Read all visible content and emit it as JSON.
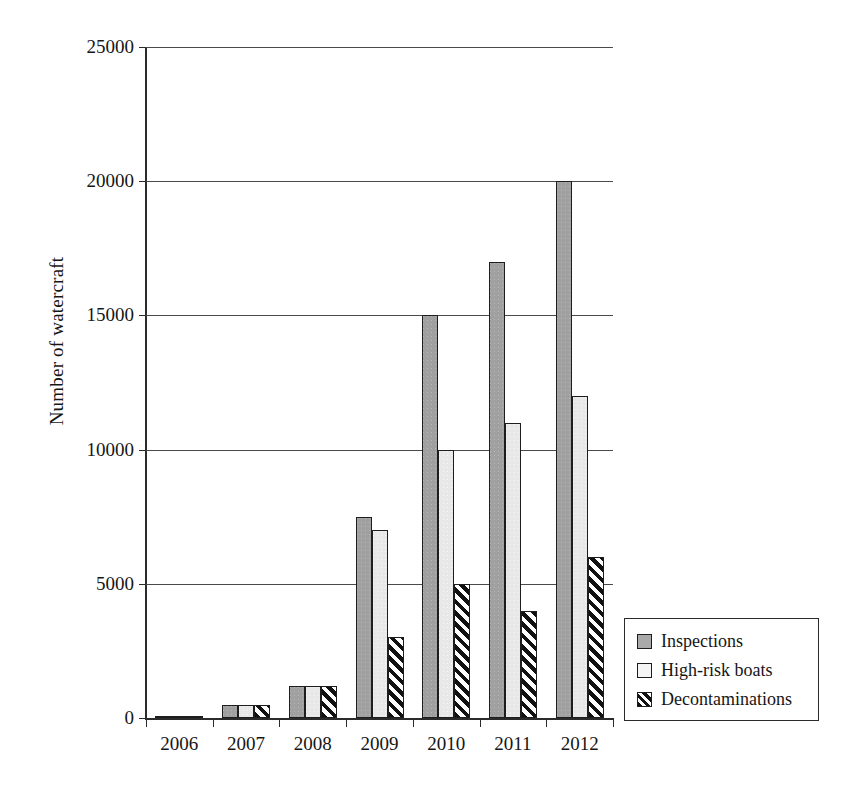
{
  "chart_data": {
    "type": "bar",
    "title": "",
    "xlabel": "",
    "ylabel": "Number of watercraft",
    "categories": [
      "2006",
      "2007",
      "2008",
      "2009",
      "2010",
      "2011",
      "2012"
    ],
    "series": [
      {
        "name": "Inspections",
        "values": [
          50,
          500,
          1200,
          7500,
          15000,
          17000,
          20000
        ]
      },
      {
        "name": "High-risk boats",
        "values": [
          50,
          500,
          1200,
          7000,
          10000,
          11000,
          12000
        ]
      },
      {
        "name": "Decontaminations",
        "values": [
          0,
          500,
          1200,
          3000,
          5000,
          4000,
          6000
        ]
      }
    ],
    "ylim": [
      0,
      25000
    ],
    "ytick_labels": [
      "0",
      "5000",
      "10000",
      "15000",
      "20000",
      "25000"
    ],
    "ytick_values": [
      0,
      5000,
      10000,
      15000,
      20000,
      25000
    ],
    "grid": true,
    "legend_position": "right-outside"
  },
  "legend": {
    "entries": [
      {
        "label": "Inspections",
        "swatch": "solid-gray-square-icon",
        "color": "#a9a9a9"
      },
      {
        "label": "High-risk boats",
        "swatch": "outlined-white-square-icon",
        "color": "#f4f4f4"
      },
      {
        "label": "Decontaminations",
        "swatch": "diagonal-hatch-square-icon",
        "color": "#111111"
      }
    ]
  },
  "colors": {
    "series_inspections": "#a9a9a9",
    "series_high_risk": "#f0f0f0",
    "series_decontaminations": "#111111",
    "axis": "#2b2b2b",
    "grid": "#4a4a4a",
    "background": "#ffffff"
  }
}
